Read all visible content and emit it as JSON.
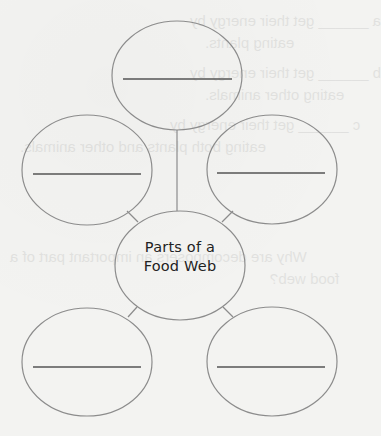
{
  "worksheet": {
    "graphic_organizer": {
      "type": "web diagram",
      "center": {
        "line1": "Parts of a",
        "line2": "Food Web"
      },
      "nodes": [
        {
          "id": "top",
          "answer": ""
        },
        {
          "id": "middle-left",
          "answer": ""
        },
        {
          "id": "middle-right",
          "answer": ""
        },
        {
          "id": "bottom-left",
          "answer": ""
        },
        {
          "id": "bottom-right",
          "answer": ""
        }
      ]
    }
  },
  "bleed_through": {
    "lines": [
      "a ______ get their energy by",
      "eating plants.",
      "b ______ get their energy by",
      "eating other animals.",
      "c ______ get their energy by",
      "eating both plants and other animals.",
      "Why are decomposers an important part of a",
      "food web?"
    ]
  },
  "colors": {
    "background": "#f3f3f1",
    "outline": "#8c8c8c",
    "answer_line": "#555555",
    "text": "#222222"
  }
}
